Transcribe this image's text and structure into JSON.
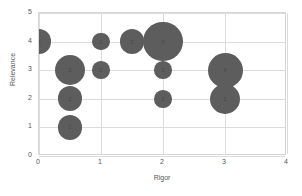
{
  "chart_data": {
    "type": "scatter",
    "title": "",
    "xlabel": "Rigor",
    "ylabel": "Relevance",
    "xlim": [
      0,
      4
    ],
    "ylim": [
      0,
      5
    ],
    "xticks": [
      "0",
      "1",
      "2",
      "3",
      "4"
    ],
    "yticks": [
      "0",
      "1",
      "2",
      "3",
      "4",
      "5"
    ],
    "grid": true,
    "legend": "none",
    "bubble_color": "#5d5d5d",
    "points": [
      {
        "x": 0,
        "y": 4,
        "size": 2,
        "label": "2"
      },
      {
        "x": 0.5,
        "y": 3,
        "size": 3,
        "label": "3"
      },
      {
        "x": 0.5,
        "y": 2,
        "size": 2,
        "label": "2"
      },
      {
        "x": 0.5,
        "y": 1,
        "size": 2,
        "label": "2"
      },
      {
        "x": 1,
        "y": 4,
        "size": 1,
        "label": "1"
      },
      {
        "x": 1,
        "y": 3,
        "size": 1,
        "label": "1"
      },
      {
        "x": 1.5,
        "y": 4,
        "size": 2,
        "label": "2"
      },
      {
        "x": 2,
        "y": 4,
        "size": 5,
        "label": "5"
      },
      {
        "x": 2,
        "y": 3,
        "size": 1,
        "label": "1"
      },
      {
        "x": 2,
        "y": 2,
        "size": 1,
        "label": "1"
      },
      {
        "x": 3,
        "y": 3,
        "size": 4,
        "label": "4"
      },
      {
        "x": 3,
        "y": 2,
        "size": 3,
        "label": "3"
      }
    ]
  }
}
